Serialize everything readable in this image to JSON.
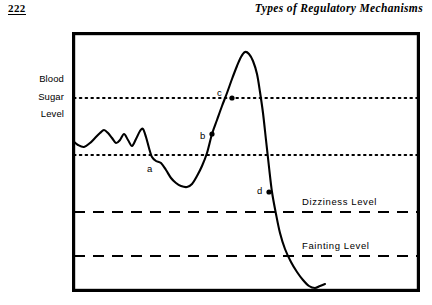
{
  "page": {
    "number": "222",
    "running_head": "Types of Regulatory Mechanisms"
  },
  "axis": {
    "line1": "Blood",
    "line2": "Sugar",
    "line3": "Level"
  },
  "reference_lines": {
    "dizziness_label": "Dizziness  Level",
    "fainting_label": "Fainting  Level"
  },
  "points": {
    "a": "a",
    "b": "b",
    "c": "c",
    "d": "d"
  },
  "colors": {
    "ink": "#000000",
    "paper": "#ffffff"
  },
  "chart_data": {
    "type": "line",
    "title": "Blood Sugar Level",
    "xlabel": "",
    "ylabel": "Blood Sugar Level",
    "grid": false,
    "legend": "none",
    "axis_box": {
      "x": 72,
      "y": 32,
      "width": 348,
      "height": 260
    },
    "xlim": [
      0,
      348
    ],
    "ylim_pixels": [
      0,
      260
    ],
    "note": "Qualitative schematic: y increases upward, no numeric tick labels are printed on either axis.",
    "reference_levels": [
      {
        "name": "upper normal limit",
        "style": "dotted",
        "y_px": 98
      },
      {
        "name": "lower normal limit",
        "style": "dotted",
        "y_px": 155
      },
      {
        "name": "Dizziness  Level",
        "style": "dashed",
        "y_px": 212
      },
      {
        "name": "Fainting  Level",
        "style": "dashed",
        "y_px": 256
      }
    ],
    "annotations": [
      {
        "label": "a",
        "marker": false,
        "point_px": [
          152,
          160
        ],
        "label_px": [
          147,
          172
        ],
        "meaning": "blood sugar falls below the lower normal limit"
      },
      {
        "label": "b",
        "marker": true,
        "point_px": [
          212,
          134
        ],
        "label_px": [
          200,
          139
        ],
        "meaning": "rising sugar crosses the lower normal limit"
      },
      {
        "label": "c",
        "marker": true,
        "point_px": [
          232,
          98
        ],
        "label_px": [
          217,
          96
        ],
        "meaning": "rising sugar crosses the upper normal limit"
      },
      {
        "label": "d",
        "marker": true,
        "point_px": [
          269,
          192
        ],
        "label_px": [
          257,
          194
        ],
        "meaning": "falling sugar heading toward the dizziness level"
      }
    ],
    "series": [
      {
        "name": "blood sugar level",
        "style": "solid",
        "points_px": [
          [
            73,
            141
          ],
          [
            78,
            145
          ],
          [
            84,
            147
          ],
          [
            90,
            143
          ],
          [
            95,
            138
          ],
          [
            100,
            133
          ],
          [
            104,
            130
          ],
          [
            108,
            133
          ],
          [
            112,
            138
          ],
          [
            116,
            143
          ],
          [
            120,
            140
          ],
          [
            124,
            134
          ],
          [
            128,
            140
          ],
          [
            132,
            146
          ],
          [
            136,
            139
          ],
          [
            140,
            131
          ],
          [
            143,
            129
          ],
          [
            146,
            137
          ],
          [
            149,
            148
          ],
          [
            152,
            157
          ],
          [
            156,
            161
          ],
          [
            161,
            163
          ],
          [
            166,
            170
          ],
          [
            171,
            178
          ],
          [
            176,
            183
          ],
          [
            181,
            186
          ],
          [
            187,
            187
          ],
          [
            192,
            184
          ],
          [
            197,
            176
          ],
          [
            202,
            166
          ],
          [
            207,
            153
          ],
          [
            212,
            134
          ],
          [
            217,
            120
          ],
          [
            222,
            106
          ],
          [
            227,
            93
          ],
          [
            232,
            79
          ],
          [
            237,
            66
          ],
          [
            241,
            57
          ],
          [
            245,
            52
          ],
          [
            249,
            54
          ],
          [
            253,
            61
          ],
          [
            257,
            74
          ],
          [
            260,
            92
          ],
          [
            263,
            113
          ],
          [
            266,
            140
          ],
          [
            269,
            167
          ],
          [
            272,
            192
          ],
          [
            276,
            214
          ],
          [
            280,
            233
          ],
          [
            285,
            249
          ],
          [
            291,
            262
          ],
          [
            297,
            272
          ],
          [
            303,
            280
          ],
          [
            309,
            286
          ],
          [
            315,
            288
          ],
          [
            320,
            286
          ],
          [
            325,
            284
          ]
        ]
      }
    ]
  }
}
